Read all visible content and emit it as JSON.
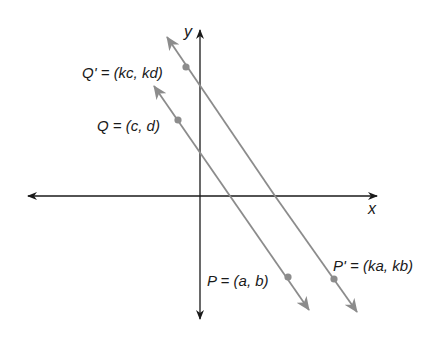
{
  "diagram": {
    "type": "coordinate-plane-parallel-lines",
    "axes": {
      "x_label": "x",
      "y_label": "y",
      "color": "#1a1a1a"
    },
    "lines": [
      {
        "name": "line-PQ",
        "color": "#8c8c8c",
        "points": [
          {
            "name": "Q",
            "label": "Q = (c, d)"
          },
          {
            "name": "P",
            "label": "P = (a, b)"
          }
        ]
      },
      {
        "name": "line-P'Q'",
        "color": "#8c8c8c",
        "points": [
          {
            "name": "Q'",
            "label": "Q' = (kc, kd)"
          },
          {
            "name": "P'",
            "label": "P' = (ka, kb)"
          }
        ]
      }
    ]
  }
}
